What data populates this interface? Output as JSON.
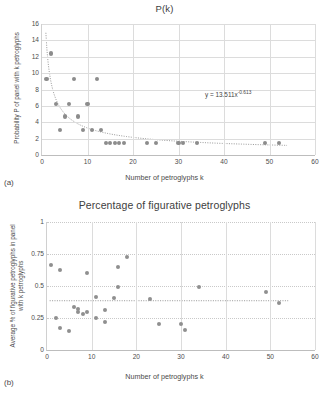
{
  "figure": {
    "panels": [
      {
        "tag": "(a)",
        "title": "P(k)",
        "xlabel": "Number of petroglyphs k",
        "ylabel": "Probability P of panel with k petroglyphs",
        "equation": "y = 13.511x",
        "equation_exponent": "-0.613"
      },
      {
        "tag": "(b)",
        "title": "Percentage of figurative petroglyphs",
        "xlabel": "Number of petroglyphs k",
        "ylabel": "Average % of figurative petroglyphs in panel with k petroglyphs"
      }
    ]
  },
  "chart_data": [
    {
      "type": "scatter",
      "title": "P(k)",
      "panel": "(a)",
      "xlabel": "Number of petroglyphs k",
      "ylabel": "Probability P of panel with k petroglyphs",
      "xlim": [
        0,
        60
      ],
      "ylim": [
        0,
        16
      ],
      "xticks": [
        0,
        10,
        20,
        30,
        40,
        50,
        60
      ],
      "yticks": [
        0,
        2,
        4,
        6,
        8,
        10,
        12,
        14,
        16
      ],
      "grid": true,
      "legend": "none",
      "marker_color": "#8c8c8c",
      "trendline": {
        "type": "power",
        "label": "y = 13.511x^-0.613",
        "coefficient": 13.511,
        "exponent": -0.613,
        "style": "dotted"
      },
      "points": [
        {
          "x": 1,
          "y": 9.3
        },
        {
          "x": 2,
          "y": 12.4
        },
        {
          "x": 3,
          "y": 6.2
        },
        {
          "x": 4,
          "y": 3.1
        },
        {
          "x": 5,
          "y": 4.7
        },
        {
          "x": 6,
          "y": 6.2
        },
        {
          "x": 7,
          "y": 9.3
        },
        {
          "x": 8,
          "y": 4.7
        },
        {
          "x": 9,
          "y": 3.1
        },
        {
          "x": 10,
          "y": 6.2
        },
        {
          "x": 11,
          "y": 3.1
        },
        {
          "x": 12,
          "y": 9.3
        },
        {
          "x": 13,
          "y": 3.1
        },
        {
          "x": 14,
          "y": 1.5
        },
        {
          "x": 15,
          "y": 1.5
        },
        {
          "x": 16,
          "y": 1.5
        },
        {
          "x": 17,
          "y": 1.5
        },
        {
          "x": 18,
          "y": 1.5
        },
        {
          "x": 23,
          "y": 1.5
        },
        {
          "x": 25,
          "y": 1.5
        },
        {
          "x": 30,
          "y": 1.5
        },
        {
          "x": 31,
          "y": 1.5
        },
        {
          "x": 34,
          "y": 1.5
        },
        {
          "x": 49,
          "y": 1.5
        },
        {
          "x": 52,
          "y": 1.5
        }
      ]
    },
    {
      "type": "scatter",
      "title": "Percentage of figurative petroglyphs",
      "panel": "(b)",
      "xlabel": "Number of petroglyphs k",
      "ylabel": "Average % of figurative petroglyphs in panel with k petroglyphs",
      "xlim": [
        0,
        60
      ],
      "ylim": [
        0,
        1
      ],
      "xticks": [
        0,
        10,
        20,
        30,
        40,
        50,
        60
      ],
      "yticks": [
        "0",
        "0.25",
        "0.5",
        "0.75",
        "1"
      ],
      "ytick_values": [
        0,
        0.25,
        0.5,
        0.75,
        1
      ],
      "grid": true,
      "legend": "none",
      "marker_color": "#8f8f8f",
      "trendline": {
        "type": "horizontal",
        "y": 0.385,
        "style": "dotted"
      },
      "points": [
        {
          "x": 1,
          "y": 0.665
        },
        {
          "x": 2,
          "y": 0.25
        },
        {
          "x": 3,
          "y": 0.625
        },
        {
          "x": 3,
          "y": 0.175
        },
        {
          "x": 5,
          "y": 0.145
        },
        {
          "x": 6,
          "y": 0.335
        },
        {
          "x": 7,
          "y": 0.32
        },
        {
          "x": 7,
          "y": 0.295
        },
        {
          "x": 8,
          "y": 0.285
        },
        {
          "x": 9,
          "y": 0.605
        },
        {
          "x": 9,
          "y": 0.295
        },
        {
          "x": 11,
          "y": 0.415
        },
        {
          "x": 11,
          "y": 0.25
        },
        {
          "x": 13,
          "y": 0.31
        },
        {
          "x": 13,
          "y": 0.22
        },
        {
          "x": 15,
          "y": 0.405
        },
        {
          "x": 16,
          "y": 0.495
        },
        {
          "x": 16,
          "y": 0.65
        },
        {
          "x": 18,
          "y": 0.73
        },
        {
          "x": 23,
          "y": 0.395
        },
        {
          "x": 25,
          "y": 0.205
        },
        {
          "x": 30,
          "y": 0.2
        },
        {
          "x": 31,
          "y": 0.16
        },
        {
          "x": 34,
          "y": 0.495
        },
        {
          "x": 49,
          "y": 0.45
        },
        {
          "x": 52,
          "y": 0.365
        }
      ]
    }
  ]
}
